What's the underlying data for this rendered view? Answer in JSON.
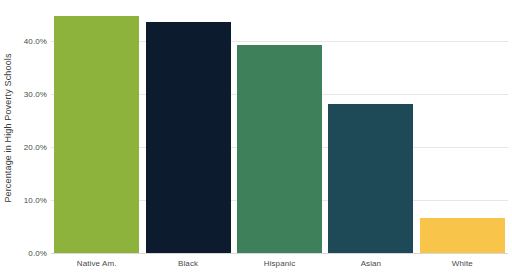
{
  "chart_data": {
    "type": "bar",
    "title": "",
    "subtitle": "",
    "xlabel": "",
    "ylabel": "Percentage in High Poverty Schools",
    "categories": [
      "Native Am.",
      "Black",
      "Hispanic",
      "Asian",
      "White"
    ],
    "values": [
      44.7,
      43.4,
      39.2,
      28.0,
      6.6
    ],
    "bar_colors": [
      "#8DB33C",
      "#0D1B2E",
      "#3E8059",
      "#1E4A57",
      "#F9C44A"
    ],
    "ylim": [
      0,
      46.5
    ],
    "y_ticks": [
      0,
      10,
      20,
      30,
      40
    ],
    "y_tick_labels": [
      "0.0%",
      "10.0%",
      "20.0%",
      "30.0%",
      "40.0%"
    ],
    "grid": true,
    "grid_axis": "y",
    "legend": false,
    "legend_position": "none",
    "background_color": "#FFFFFF",
    "grid_color": "#E7E7E7",
    "axis_text_color": "#4A4A4A"
  }
}
